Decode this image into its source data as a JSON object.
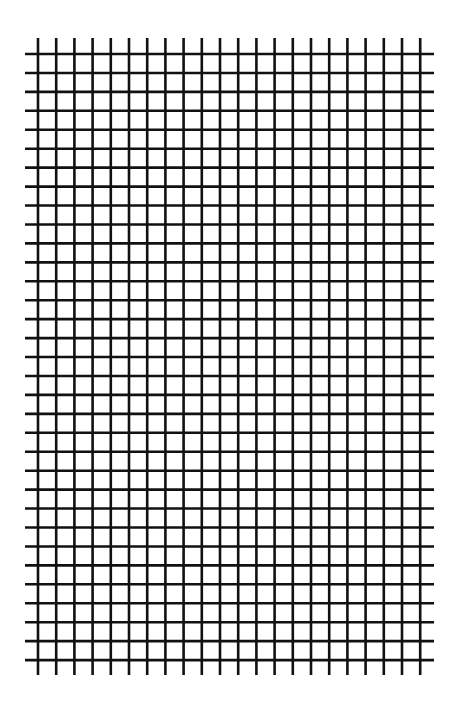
{
  "diagram": {
    "type": "grid",
    "background_color": "#ffffff",
    "line_color": "#111111",
    "line_width": 2.6,
    "vertical_lines": {
      "count": 22,
      "first_x": 38,
      "spacing": 18.2,
      "y_start": 38,
      "y_end": 675
    },
    "horizontal_lines": {
      "count": 33,
      "first_y": 54,
      "spacing": 18.94,
      "x_start": 25,
      "x_end": 434
    }
  }
}
